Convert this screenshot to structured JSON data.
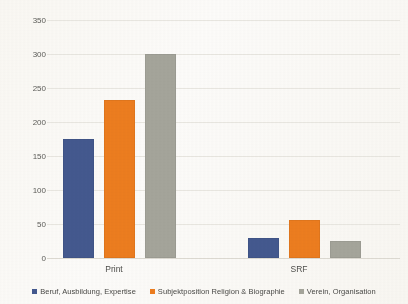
{
  "chart_data": {
    "type": "bar",
    "title": "",
    "xlabel": "",
    "ylabel": "",
    "categories": [
      "Print",
      "SRF"
    ],
    "series": [
      {
        "name": "Beruf, Ausbildung, Expertise",
        "color": "#44598f",
        "values": [
          175,
          30
        ]
      },
      {
        "name": "Subjektposition Religion & Biographie",
        "color": "#ed7d1f",
        "values": [
          233,
          56
        ]
      },
      {
        "name": "Verein, Organisation",
        "color": "#a5a59b",
        "values": [
          300,
          25
        ]
      }
    ],
    "ylim": [
      0,
      350
    ],
    "ytick_step": 50,
    "yticks": [
      "0",
      "50",
      "100",
      "150",
      "200",
      "250",
      "300",
      "350"
    ],
    "grid": true,
    "legend_position": "bottom"
  },
  "axis": {
    "y_labels": [
      "350",
      "300",
      "250",
      "200",
      "150",
      "100",
      "50",
      "0"
    ],
    "x_labels": [
      "Print",
      "SRF"
    ]
  },
  "legend": {
    "items": [
      {
        "label": "Beruf, Ausbildung, Expertise",
        "color": "#44598f"
      },
      {
        "label": "Subjektposition Religion & Biographie",
        "color": "#ed7d1f"
      },
      {
        "label": "Verein, Organisation",
        "color": "#a5a59b"
      }
    ]
  },
  "colors": {
    "series_blue": "#44598f",
    "series_orange": "#ed7d1f",
    "series_gray": "#a5a59b",
    "gridline": "#e9e7e1",
    "background": "#fdfcfa",
    "text": "#4d4d4a"
  }
}
